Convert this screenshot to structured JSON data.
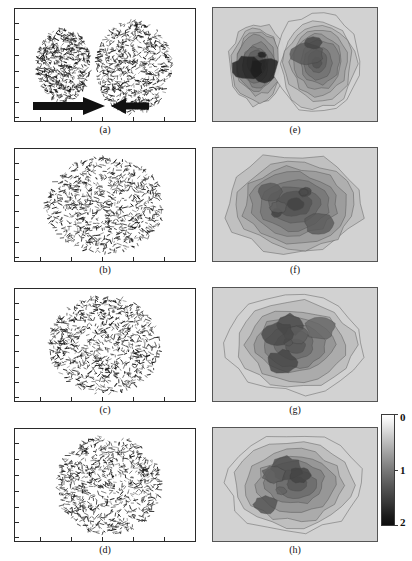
{
  "figure": {
    "title": "",
    "panel_labels": [
      "(a)",
      "(b)",
      "(c)",
      "(d)",
      "(e)",
      "(f)",
      "(g)",
      "(h)"
    ],
    "left_column_type": "vector-segment-scatter",
    "right_column_type": "greyscale-contour-density-map"
  },
  "colorbar": {
    "orientation": "vertical",
    "min_label": "0",
    "mid_label": "1",
    "max_label": "2",
    "ticks": [
      "0",
      "1",
      "2"
    ],
    "top_color": "#ffffff",
    "bottom_color": "#0d0d0d"
  },
  "panels": {
    "a": {
      "label": "(a)",
      "caption": "(a)",
      "background": "#ffffff",
      "annotation_right_arrow": "right-arrow",
      "annotation_left_arrow": "left-arrow",
      "clusters": 2
    },
    "b": {
      "label": "(b)",
      "caption": "(b)",
      "background": "#ffffff",
      "clusters": 1
    },
    "c": {
      "label": "(c)",
      "caption": "(c)",
      "background": "#ffffff",
      "clusters": 1
    },
    "d": {
      "label": "(d)",
      "caption": "(d)",
      "background": "#ffffff",
      "clusters": 1
    },
    "e": {
      "label": "(e)",
      "caption": "(e)",
      "background": "#d2d2d2",
      "blobs": 2
    },
    "f": {
      "label": "(f)",
      "caption": "(f)",
      "background": "#d2d2d2",
      "blobs": 1
    },
    "g": {
      "label": "(g)",
      "caption": "(g)",
      "background": "#d2d2d2",
      "blobs": 1
    },
    "h": {
      "label": "(h)",
      "caption": "(h)",
      "background": "#d2d2d2",
      "blobs": 1
    }
  },
  "chart_data": {
    "type": "scatter",
    "title": "",
    "xlabel": "",
    "ylabel": "",
    "grid": false,
    "legend": "none",
    "colorbar_range": [
      0,
      2
    ],
    "colorbar_ticks": [
      0,
      1,
      2
    ],
    "panel_series": [
      {
        "name": "(a)",
        "kind": "segment-scatter",
        "clusters": 2,
        "cluster_centers": [
          [
            0.27,
            0.5
          ],
          [
            0.66,
            0.52
          ]
        ],
        "cluster_radii": [
          [
            0.15,
            0.33
          ],
          [
            0.21,
            0.42
          ]
        ],
        "counts": [
          620,
          700
        ],
        "density": [
          1.9,
          0.85
        ],
        "annotations": [
          "right-arrow",
          "left-arrow"
        ]
      },
      {
        "name": "(b)",
        "kind": "segment-scatter",
        "clusters": 1,
        "cluster_centers": [
          [
            0.5,
            0.5
          ]
        ],
        "cluster_radii": [
          [
            0.33,
            0.43
          ]
        ],
        "counts": [
          900
        ],
        "density": [
          1.1
        ]
      },
      {
        "name": "(c)",
        "kind": "segment-scatter",
        "clusters": 1,
        "cluster_centers": [
          [
            0.5,
            0.5
          ]
        ],
        "cluster_radii": [
          [
            0.31,
            0.44
          ]
        ],
        "counts": [
          880
        ],
        "density": [
          1.05
        ]
      },
      {
        "name": "(d)",
        "kind": "segment-scatter",
        "clusters": 1,
        "cluster_centers": [
          [
            0.52,
            0.5
          ]
        ],
        "cluster_radii": [
          [
            0.29,
            0.44
          ]
        ],
        "counts": [
          860
        ],
        "density": [
          1.0
        ]
      },
      {
        "name": "(e)",
        "kind": "contour-density",
        "blobs": 2,
        "blob_centers": [
          [
            0.27,
            0.5
          ],
          [
            0.64,
            0.48
          ]
        ],
        "peak_values": [
          2.0,
          0.9
        ],
        "contour_levels": [
          0.2,
          0.4,
          0.6,
          0.8,
          1.0,
          1.2,
          1.4,
          1.6,
          1.8
        ]
      },
      {
        "name": "(f)",
        "kind": "contour-density",
        "blobs": 1,
        "blob_centers": [
          [
            0.5,
            0.5
          ]
        ],
        "peak_values": [
          1.6
        ],
        "contour_levels": [
          0.2,
          0.4,
          0.6,
          0.8,
          1.0,
          1.2,
          1.4,
          1.6
        ]
      },
      {
        "name": "(g)",
        "kind": "contour-density",
        "blobs": 1,
        "blob_centers": [
          [
            0.5,
            0.5
          ]
        ],
        "peak_values": [
          1.5
        ],
        "contour_levels": [
          0.2,
          0.4,
          0.6,
          0.8,
          1.0,
          1.2,
          1.4
        ]
      },
      {
        "name": "(h)",
        "kind": "contour-density",
        "blobs": 1,
        "blob_centers": [
          [
            0.5,
            0.5
          ]
        ],
        "peak_values": [
          1.5
        ],
        "contour_levels": [
          0.2,
          0.4,
          0.6,
          0.8,
          1.0,
          1.2,
          1.4
        ]
      }
    ]
  }
}
